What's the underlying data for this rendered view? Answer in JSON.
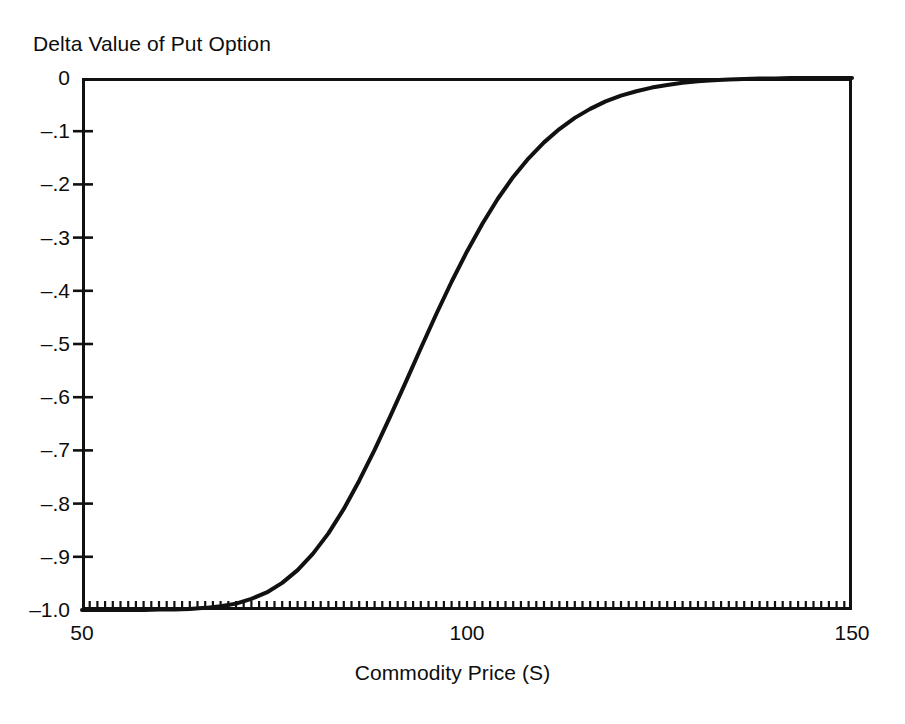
{
  "chart_data": {
    "type": "line",
    "title": "Delta Value of Put Option",
    "xlabel": "Commodity Price (S)",
    "ylabel": "",
    "xlim": [
      50,
      150
    ],
    "ylim": [
      -1.0,
      0
    ],
    "grid": false,
    "legend": null,
    "x_major_ticks": [
      50,
      100,
      150
    ],
    "x_major_tick_labels": [
      "50",
      "100",
      "150"
    ],
    "x_minor_tick_step": 1,
    "y_ticks": [
      0,
      -0.1,
      -0.2,
      -0.3,
      -0.4,
      -0.5,
      -0.6,
      -0.7,
      -0.8,
      -0.9,
      -1.0
    ],
    "y_tick_labels": [
      "0",
      "–.1",
      "–.2",
      "–.3",
      "–.4",
      "–.5",
      "–.6",
      "–.7",
      "–.8",
      "–.9",
      "–1.0"
    ],
    "series": [
      {
        "name": "Put delta",
        "color": "#111111",
        "linewidth": 4,
        "x": [
          50,
          52,
          54,
          56,
          58,
          60,
          62,
          64,
          66,
          68,
          70,
          72,
          74,
          76,
          78,
          80,
          82,
          84,
          86,
          88,
          90,
          92,
          94,
          96,
          98,
          100,
          102,
          104,
          106,
          108,
          110,
          112,
          114,
          116,
          118,
          120,
          122,
          124,
          126,
          128,
          130,
          132,
          134,
          136,
          138,
          140,
          142,
          144,
          146,
          148,
          150
        ],
        "values": [
          -1.0,
          -1.0,
          -1.0,
          -1.0,
          -1.0,
          -0.999,
          -0.999,
          -0.998,
          -0.996,
          -0.993,
          -0.988,
          -0.979,
          -0.967,
          -0.949,
          -0.925,
          -0.894,
          -0.856,
          -0.81,
          -0.757,
          -0.699,
          -0.637,
          -0.573,
          -0.508,
          -0.444,
          -0.383,
          -0.326,
          -0.274,
          -0.227,
          -0.186,
          -0.151,
          -0.121,
          -0.096,
          -0.075,
          -0.058,
          -0.044,
          -0.033,
          -0.025,
          -0.018,
          -0.013,
          -0.009,
          -0.006,
          -0.004,
          -0.003,
          -0.002,
          -0.001,
          -0.001,
          0.0,
          0.0,
          0.0,
          0.0,
          0.0
        ]
      }
    ],
    "annotations": []
  },
  "axes": {
    "title_label": "Delta Value of Put Option",
    "x_title": "Commodity Price (S)",
    "x_tick_labels": [
      "50",
      "100",
      "150"
    ],
    "y_tick_labels": [
      "0",
      "–.1",
      "–.2",
      "–.3",
      "–.4",
      "–.5",
      "–.6",
      "–.7",
      "–.8",
      "–.9",
      "–1.0"
    ]
  },
  "colors": {
    "ink": "#111111",
    "background": "#ffffff"
  }
}
